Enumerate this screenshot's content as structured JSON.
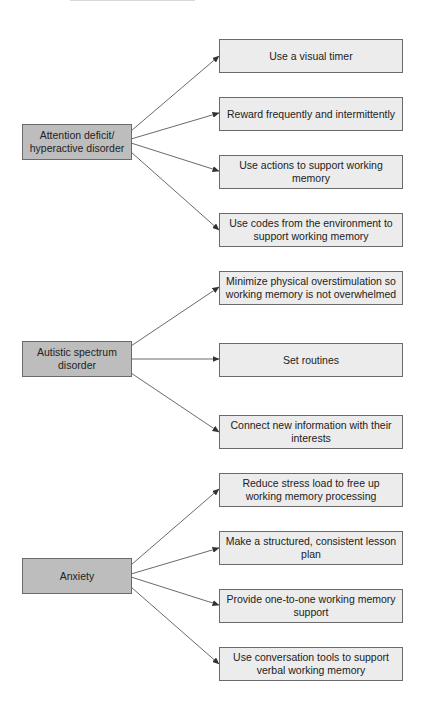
{
  "header": {
    "fragment_text": ""
  },
  "colors": {
    "category_fill": "#bdbdbd",
    "strategy_fill": "#ececec",
    "border": "#6a6a6a",
    "arrow": "#333333"
  },
  "groups": [
    {
      "category": "Attention deficit/ hyperactive disorder",
      "strategies": [
        "Use a visual timer",
        "Reward frequently and intermittently",
        "Use actions to support working memory",
        "Use codes from the environment to support working memory"
      ]
    },
    {
      "category": "Autistic spectrum disorder",
      "strategies": [
        "Minimize physical overstimulation so working memory is not overwhelmed",
        "Set routines",
        "Connect new information with their interests"
      ]
    },
    {
      "category": "Anxiety",
      "strategies": [
        "Reduce stress load to free up working memory processing",
        "Make a structured, consistent lesson plan",
        "Provide one-to-one working memory support",
        "Use conversation tools to support verbal working memory"
      ]
    }
  ]
}
